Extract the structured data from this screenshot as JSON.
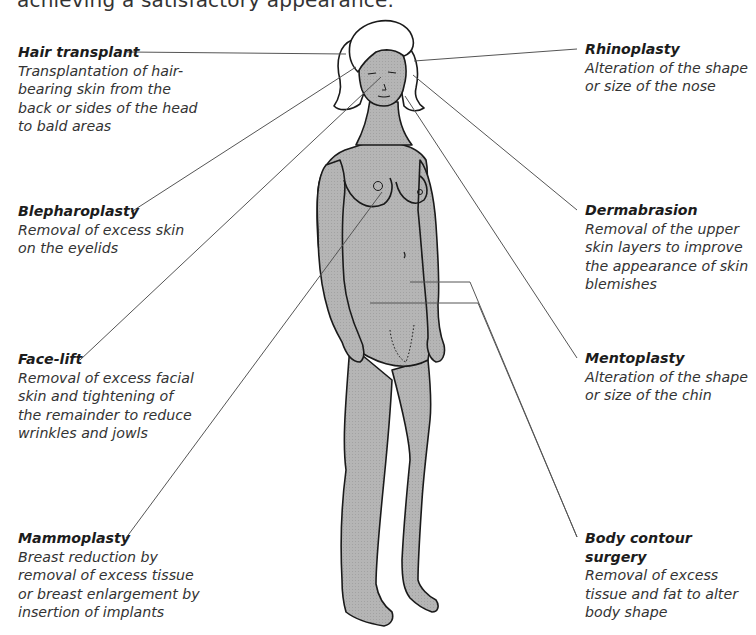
{
  "intro_text": "achieving a satisfactory appearance.",
  "figure": {
    "skin_color": "#b3b3b3",
    "outline_color": "#1a1a1a",
    "leader_color": "#555555"
  },
  "procedures_left": [
    {
      "title": "Hair transplant",
      "desc": [
        "Transplantation of hair-",
        "bearing skin from the",
        "back or sides of the head",
        "to bald areas"
      ]
    },
    {
      "title": "Blepharoplasty",
      "desc": [
        "Removal of excess skin",
        "on the eyelids"
      ]
    },
    {
      "title": "Face-lift",
      "desc": [
        "Removal of excess facial",
        "skin and tightening of",
        "the remainder to reduce",
        "wrinkles and jowls"
      ]
    },
    {
      "title": "Mammoplasty",
      "desc": [
        "Breast reduction by",
        "removal of excess tissue",
        "or breast enlargement by",
        "insertion of implants"
      ]
    }
  ],
  "procedures_right": [
    {
      "title": "Rhinoplasty",
      "desc": [
        "Alteration of the shape",
        "or size of the nose"
      ]
    },
    {
      "title": "Dermabrasion",
      "desc": [
        "Removal of the upper",
        "skin layers to improve",
        "the appearance of skin",
        "blemishes"
      ]
    },
    {
      "title": "Mentoplasty",
      "desc": [
        "Alteration of the shape",
        "or size of the chin"
      ]
    },
    {
      "title": "Body contour surgery",
      "desc": [
        "Removal of excess",
        "tissue and fat to alter",
        "body shape"
      ]
    }
  ]
}
